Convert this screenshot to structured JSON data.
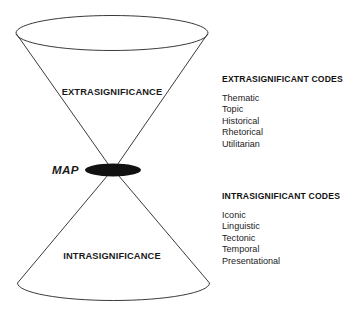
{
  "diagram": {
    "figure_labels": {
      "upper_cone": "EXTRASIGNIFICANCE",
      "lower_cone": "INTRASIGNIFICANCE",
      "apex": "MAP"
    },
    "colors": {
      "background": "#ffffff",
      "stroke": "#3a3a3a",
      "apex_fill": "#111111",
      "text": "#1a1a1a"
    },
    "geometry": {
      "upper_rim_ellipse": {
        "cx": 112,
        "cy": 33,
        "rx": 96,
        "ry": 17
      },
      "lower_rim_arc": {
        "cx": 113,
        "cy": 283,
        "rx": 96,
        "ry": 17
      },
      "apex_ellipse": {
        "cx": 113,
        "cy": 170,
        "rx": 28,
        "ry": 6.5
      }
    }
  },
  "code_blocks": [
    {
      "id": "extrasignificant",
      "heading": "EXTRASIGNIFICANT CODES",
      "items": [
        "Thematic",
        "Topic",
        "Historical",
        "Rhetorical",
        "Utilitarian"
      ]
    },
    {
      "id": "intrasignificant",
      "heading": "INTRASIGNIFICANT CODES",
      "items": [
        "Iconic",
        "Linguistic",
        "Tectonic",
        "Temporal",
        "Presentational"
      ]
    }
  ]
}
